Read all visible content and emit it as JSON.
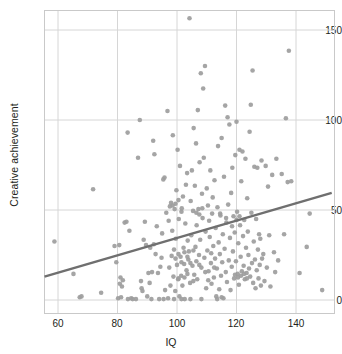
{
  "chart_data": {
    "type": "scatter",
    "title": "",
    "xlabel": "IQ",
    "ylabel": "Creative achievement",
    "xlim": [
      54,
      152
    ],
    "ylim": [
      -8,
      165
    ],
    "xticks": [
      60,
      80,
      100,
      120,
      140
    ],
    "yticks": [
      0,
      50,
      100,
      150
    ],
    "grid": true,
    "grid_color": "#d6d6d6",
    "frame_color": "#c9c9c9",
    "point_color": "#9d9d9d",
    "point_size": 4.6,
    "legend": "none",
    "series": [
      {
        "name": "Participants",
        "marker": "circle",
        "points": [
          [
            58.8,
            32.5
          ],
          [
            65.2,
            14.5
          ],
          [
            67.3,
            1.5
          ],
          [
            67.9,
            2.0
          ],
          [
            71.8,
            61.5
          ],
          [
            74.5,
            4.0
          ],
          [
            79.0,
            30.0
          ],
          [
            79.6,
            21.0
          ],
          [
            80.2,
            1.0
          ],
          [
            80.6,
            30.5
          ],
          [
            80.8,
            9.0
          ],
          [
            81.0,
            12.5
          ],
          [
            81.2,
            1.5
          ],
          [
            81.5,
            7.5
          ],
          [
            81.8,
            11.0
          ],
          [
            82.4,
            43.0
          ],
          [
            83.0,
            43.5
          ],
          [
            83.4,
            93.0
          ],
          [
            84.0,
            38.5
          ],
          [
            84.6,
            1.0
          ],
          [
            85.1,
            0.5
          ],
          [
            86.2,
            0.5
          ],
          [
            86.9,
            79.0
          ],
          [
            87.5,
            100.0
          ],
          [
            87.9,
            10.5
          ],
          [
            88.1,
            6.5
          ],
          [
            88.4,
            5.0
          ],
          [
            88.8,
            33.5
          ],
          [
            89.2,
            43.5
          ],
          [
            89.6,
            30.5
          ],
          [
            90.0,
            2.0
          ],
          [
            90.4,
            15.0
          ],
          [
            90.8,
            9.5
          ],
          [
            91.0,
            29.0
          ],
          [
            91.4,
            0.5
          ],
          [
            91.6,
            15.5
          ],
          [
            92.0,
            88.5
          ],
          [
            92.2,
            31.0
          ],
          [
            92.4,
            81.0
          ],
          [
            92.8,
            25.5
          ],
          [
            93.2,
            41.0
          ],
          [
            93.6,
            15.0
          ],
          [
            94.0,
            0.5
          ],
          [
            94.4,
            18.5
          ],
          [
            94.8,
            23.5
          ],
          [
            95.0,
            37.0
          ],
          [
            95.4,
            67.0
          ],
          [
            95.8,
            68.0
          ],
          [
            96.0,
            5.5
          ],
          [
            96.4,
            48.5
          ],
          [
            96.8,
            105.0
          ],
          [
            97.0,
            1.0
          ],
          [
            97.2,
            44.0
          ],
          [
            97.4,
            18.0
          ],
          [
            97.6,
            52.0
          ],
          [
            97.8,
            8.0
          ],
          [
            98.0,
            54.0
          ],
          [
            98.2,
            24.5
          ],
          [
            98.4,
            38.5
          ],
          [
            98.6,
            91.5
          ],
          [
            98.8,
            13.0
          ],
          [
            99.0,
            28.0
          ],
          [
            99.2,
            50.5
          ],
          [
            99.4,
            5.0
          ],
          [
            99.6,
            34.0
          ],
          [
            99.8,
            61.0
          ],
          [
            100.0,
            19.5
          ],
          [
            100.2,
            83.5
          ],
          [
            100.4,
            11.5
          ],
          [
            100.6,
            45.0
          ],
          [
            100.8,
            2.0
          ],
          [
            101.0,
            74.5
          ],
          [
            101.2,
            24.0
          ],
          [
            101.4,
            13.5
          ],
          [
            101.6,
            51.0
          ],
          [
            101.8,
            8.0
          ],
          [
            102.0,
            57.5
          ],
          [
            102.2,
            29.0
          ],
          [
            102.4,
            20.0
          ],
          [
            102.6,
            0.5
          ],
          [
            102.8,
            42.5
          ],
          [
            103.0,
            64.0
          ],
          [
            103.2,
            16.5
          ],
          [
            103.4,
            70.5
          ],
          [
            103.6,
            33.0
          ],
          [
            103.8,
            22.5
          ],
          [
            104.0,
            27.0
          ],
          [
            104.2,
            156.5
          ],
          [
            104.4,
            9.5
          ],
          [
            104.6,
            55.0
          ],
          [
            104.8,
            36.0
          ],
          [
            105.0,
            72.0
          ],
          [
            105.2,
            19.0
          ],
          [
            105.4,
            49.5
          ],
          [
            105.6,
            95.5
          ],
          [
            105.8,
            14.0
          ],
          [
            106.0,
            63.5
          ],
          [
            106.2,
            29.5
          ],
          [
            106.4,
            87.0
          ],
          [
            106.6,
            41.5
          ],
          [
            106.8,
            11.5
          ],
          [
            107.0,
            105.5
          ],
          [
            107.2,
            50.5
          ],
          [
            107.4,
            25.0
          ],
          [
            107.6,
            76.5
          ],
          [
            107.8,
            33.5
          ],
          [
            108.0,
            126.0
          ],
          [
            108.2,
            18.0
          ],
          [
            108.4,
            59.0
          ],
          [
            108.6,
            45.5
          ],
          [
            108.8,
            117.5
          ],
          [
            109.0,
            79.0
          ],
          [
            109.2,
            23.5
          ],
          [
            109.4,
            130.0
          ],
          [
            109.6,
            38.0
          ],
          [
            109.8,
            6.5
          ],
          [
            110.0,
            62.0
          ],
          [
            110.2,
            27.5
          ],
          [
            110.4,
            52.5
          ],
          [
            110.6,
            16.0
          ],
          [
            110.8,
            44.0
          ],
          [
            111.0,
            35.0
          ],
          [
            111.2,
            72.0
          ],
          [
            111.4,
            20.5
          ],
          [
            111.6,
            9.0
          ],
          [
            111.8,
            48.0
          ],
          [
            112.0,
            57.0
          ],
          [
            112.2,
            30.0
          ],
          [
            112.4,
            12.5
          ],
          [
            112.6,
            66.5
          ],
          [
            112.8,
            23.0
          ],
          [
            113.0,
            40.0
          ],
          [
            113.2,
            2.0
          ],
          [
            113.4,
            17.5
          ],
          [
            113.6,
            51.5
          ],
          [
            113.8,
            85.5
          ],
          [
            114.0,
            32.0
          ],
          [
            114.2,
            6.0
          ],
          [
            114.4,
            25.5
          ],
          [
            114.6,
            47.0
          ],
          [
            114.8,
            13.5
          ],
          [
            115.0,
            90.0
          ],
          [
            115.2,
            21.0
          ],
          [
            115.4,
            36.5
          ],
          [
            115.6,
            1.0
          ],
          [
            115.8,
            68.5
          ],
          [
            116.0,
            28.5
          ],
          [
            116.2,
            108.0
          ],
          [
            116.4,
            15.5
          ],
          [
            116.6,
            43.0
          ],
          [
            116.8,
            10.0
          ],
          [
            117.0,
            101.5
          ],
          [
            117.2,
            53.0
          ],
          [
            117.4,
            22.0
          ],
          [
            117.6,
            97.5
          ],
          [
            117.8,
            34.5
          ],
          [
            118.0,
            5.5
          ],
          [
            118.2,
            59.5
          ],
          [
            118.4,
            18.5
          ],
          [
            118.6,
            73.5
          ],
          [
            118.8,
            27.0
          ],
          [
            119.0,
            46.5
          ],
          [
            119.2,
            12.0
          ],
          [
            119.4,
            37.5
          ],
          [
            119.6,
            80.5
          ],
          [
            119.8,
            21.5
          ],
          [
            120.0,
            99.0
          ],
          [
            120.2,
            49.0
          ],
          [
            120.4,
            14.5
          ],
          [
            120.6,
            31.5
          ],
          [
            120.8,
            8.5
          ],
          [
            121.0,
            83.5
          ],
          [
            121.2,
            41.5
          ],
          [
            121.4,
            24.0
          ],
          [
            121.6,
            66.0
          ],
          [
            121.8,
            16.0
          ],
          [
            122.0,
            82.5
          ],
          [
            122.2,
            35.5
          ],
          [
            122.4,
            19.0
          ],
          [
            122.6,
            44.5
          ],
          [
            122.8,
            11.5
          ],
          [
            123.0,
            78.5
          ],
          [
            123.2,
            29.0
          ],
          [
            123.4,
            15.0
          ],
          [
            123.6,
            56.5
          ],
          [
            123.8,
            38.0
          ],
          [
            124.0,
            25.0
          ],
          [
            124.2,
            17.5
          ],
          [
            124.4,
            93.5
          ],
          [
            124.6,
            13.0
          ],
          [
            124.8,
            108.5
          ],
          [
            125.0,
            48.5
          ],
          [
            125.2,
            20.5
          ],
          [
            125.4,
            127.5
          ],
          [
            125.6,
            9.5
          ],
          [
            125.8,
            32.5
          ],
          [
            126.0,
            74.0
          ],
          [
            126.2,
            22.5
          ],
          [
            126.4,
            6.5
          ],
          [
            126.6,
            45.0
          ],
          [
            126.8,
            16.5
          ],
          [
            127.0,
            73.5
          ],
          [
            127.2,
            28.0
          ],
          [
            127.4,
            12.0
          ],
          [
            127.6,
            36.5
          ],
          [
            127.8,
            19.5
          ],
          [
            128.0,
            34.0
          ],
          [
            128.2,
            8.0
          ],
          [
            128.4,
            77.5
          ],
          [
            128.6,
            23.0
          ],
          [
            129.0,
            25.5
          ],
          [
            129.4,
            10.5
          ],
          [
            129.8,
            74.5
          ],
          [
            130.2,
            18.0
          ],
          [
            130.6,
            63.0
          ],
          [
            131.0,
            36.0
          ],
          [
            131.4,
            7.5
          ],
          [
            132.0,
            69.5
          ],
          [
            132.6,
            26.5
          ],
          [
            133.0,
            15.5
          ],
          [
            133.4,
            78.5
          ],
          [
            134.0,
            22.0
          ],
          [
            135.2,
            70.0
          ],
          [
            136.0,
            36.5
          ],
          [
            136.6,
            101.0
          ],
          [
            137.2,
            65.5
          ],
          [
            137.6,
            138.5
          ],
          [
            138.4,
            66.0
          ],
          [
            141.2,
            15.0
          ],
          [
            143.6,
            29.5
          ],
          [
            144.6,
            48.0
          ],
          [
            148.8,
            5.5
          ],
          [
            99.0,
            0.5
          ],
          [
            101.5,
            0.5
          ],
          [
            104.5,
            0.5
          ],
          [
            108.2,
            0.5
          ],
          [
            113.5,
            0.5
          ],
          [
            115.0,
            1.5
          ],
          [
            83.5,
            0.5
          ],
          [
            95.5,
            0.5
          ],
          [
            100.5,
            12.0
          ],
          [
            102.5,
            12.5
          ],
          [
            103.5,
            14.5
          ],
          [
            105.5,
            10.5
          ],
          [
            106.5,
            21.5
          ],
          [
            107.5,
            19.5
          ],
          [
            109.5,
            15.5
          ],
          [
            110.5,
            11.0
          ],
          [
            111.5,
            26.0
          ],
          [
            112.5,
            18.0
          ],
          [
            119.5,
            14.0
          ],
          [
            120.5,
            12.5
          ],
          [
            121.5,
            13.5
          ],
          [
            122.5,
            14.5
          ],
          [
            123.5,
            12.0
          ],
          [
            99.5,
            23.0
          ],
          [
            100.5,
            25.5
          ],
          [
            101.5,
            21.0
          ],
          [
            102.5,
            26.5
          ],
          [
            103.5,
            24.0
          ],
          [
            104.5,
            20.5
          ],
          [
            105.5,
            27.5
          ],
          [
            98.5,
            52.5
          ],
          [
            99.5,
            53.5
          ],
          [
            100.5,
            55.5
          ],
          [
            101.5,
            49.0
          ],
          [
            106.5,
            48.5
          ],
          [
            107.5,
            47.5
          ],
          [
            108.5,
            51.0
          ],
          [
            114.5,
            48.0
          ],
          [
            116.5,
            45.5
          ],
          [
            118.5,
            41.0
          ],
          [
            120.0,
            44.5
          ],
          [
            121.0,
            46.5
          ]
        ]
      }
    ],
    "trendline": {
      "name": "regression-line",
      "color": "#6f6f6f",
      "width": 2.4,
      "x_start": 54,
      "y_start": 13.0,
      "x_end": 152,
      "y_end": 59.5
    }
  }
}
